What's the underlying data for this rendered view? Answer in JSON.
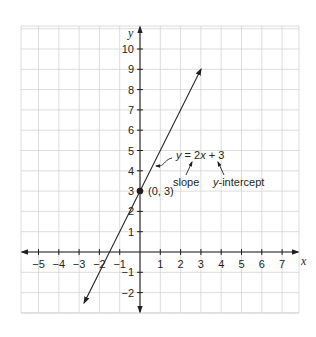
{
  "chart_data": {
    "type": "line",
    "title": "",
    "xlabel": "x",
    "ylabel": "y",
    "xlim": [
      -6,
      8
    ],
    "ylim": [
      -3,
      11
    ],
    "grid": true,
    "x_ticks": [
      -5,
      -4,
      -3,
      -2,
      -1,
      1,
      2,
      3,
      4,
      5,
      6,
      7
    ],
    "y_ticks": [
      -2,
      -1,
      1,
      2,
      3,
      4,
      5,
      6,
      7,
      8,
      9,
      10
    ],
    "x_tick_labels": [
      "−5",
      "−4",
      "−3",
      "−2",
      "−1",
      "1",
      "2",
      "3",
      "4",
      "5",
      "6",
      "7"
    ],
    "y_tick_labels": [
      "−2",
      "−1",
      "1",
      "2",
      "3",
      "4",
      "5",
      "6",
      "7",
      "8",
      "9",
      "10"
    ],
    "series": [
      {
        "name": "y = 2x + 3",
        "equation": "y = 2x + 3",
        "slope": 2,
        "intercept": 3,
        "x": [
          -2.75,
          3
        ],
        "y": [
          -2.5,
          9
        ],
        "arrows": "both"
      }
    ],
    "points": [
      {
        "label": "(0, 3)",
        "x": 0,
        "y": 3
      }
    ],
    "annotations": [
      {
        "text": "y = 2x + 3",
        "points_to": "line"
      },
      {
        "text": "slope",
        "points_to": "2"
      },
      {
        "text": "y-intercept",
        "points_to": "3"
      }
    ]
  },
  "labels": {
    "x_axis": "x",
    "y_axis": "y",
    "point": "(0, 3)",
    "eq_y": "y",
    "eq_rest": " = 2",
    "eq_x": "x",
    "eq_tail": " + 3",
    "slope": "slope",
    "yint_y": "y",
    "yint_rest": "-intercept"
  },
  "colors": {
    "grid": "#d3d3d3",
    "axis": "#231f20",
    "line": "#231f20"
  }
}
